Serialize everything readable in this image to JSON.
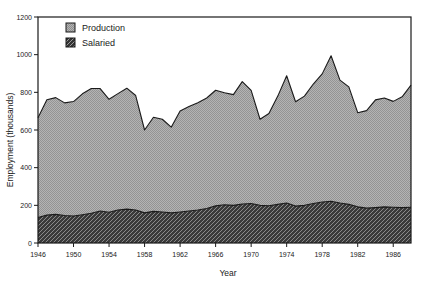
{
  "chart_data": {
    "type": "area",
    "stacked": true,
    "title": "",
    "xlabel": "Year",
    "ylabel": "Employment (thousands)",
    "xlim": [
      1946,
      1988
    ],
    "ylim": [
      0,
      1200
    ],
    "yticks": [
      0,
      200,
      400,
      600,
      800,
      1000,
      1200
    ],
    "xticks": [
      1946,
      1950,
      1954,
      1958,
      1962,
      1966,
      1970,
      1974,
      1978,
      1982,
      1986
    ],
    "grid": false,
    "legend_position": "top-left",
    "x": [
      1946,
      1947,
      1948,
      1949,
      1950,
      1951,
      1952,
      1953,
      1954,
      1955,
      1956,
      1957,
      1958,
      1959,
      1960,
      1961,
      1962,
      1963,
      1964,
      1965,
      1966,
      1967,
      1968,
      1969,
      1970,
      1971,
      1972,
      1973,
      1974,
      1975,
      1976,
      1977,
      1978,
      1979,
      1980,
      1981,
      1982,
      1983,
      1984,
      1985,
      1986,
      1987,
      1988
    ],
    "series": [
      {
        "name": "Salaried",
        "fill_color": "#3b3b3b",
        "pattern": "diagonal-hatch",
        "values": [
          135,
          148,
          152,
          146,
          143,
          150,
          158,
          170,
          163,
          175,
          180,
          175,
          160,
          168,
          165,
          160,
          165,
          170,
          175,
          183,
          197,
          203,
          200,
          207,
          210,
          200,
          198,
          205,
          212,
          196,
          200,
          210,
          218,
          222,
          212,
          205,
          192,
          185,
          188,
          192,
          190,
          188,
          190
        ]
      },
      {
        "name": "Production",
        "fill_color": "#a8a8a8",
        "pattern": "stipple",
        "values": [
          530,
          613,
          620,
          598,
          608,
          642,
          662,
          650,
          600,
          618,
          642,
          608,
          440,
          500,
          492,
          455,
          536,
          555,
          570,
          587,
          614,
          595,
          588,
          650,
          600,
          457,
          490,
          575,
          676,
          554,
          580,
          634,
          680,
          772,
          653,
          624,
          500,
          518,
          572,
          578,
          562,
          588,
          648
        ]
      }
    ],
    "totals": [
      665,
      761,
      772,
      744,
      751,
      792,
      820,
      820,
      763,
      793,
      822,
      783,
      600,
      668,
      657,
      615,
      701,
      725,
      745,
      770,
      811,
      798,
      788,
      857,
      810,
      657,
      688,
      780,
      888,
      750,
      780,
      844,
      898,
      994,
      865,
      829,
      692,
      703,
      760,
      770,
      752,
      776,
      838
    ],
    "series_order_bottom_to_top": [
      "Salaried",
      "Production"
    ]
  },
  "legend": {
    "items": [
      {
        "label": "Production",
        "swatch": "production-swatch"
      },
      {
        "label": "Salaried",
        "swatch": "salaried-swatch"
      }
    ]
  },
  "axes": {
    "y_title": "Employment (thousands)",
    "x_title": "Year",
    "y_tick_labels": [
      "0",
      "200",
      "400",
      "600",
      "800",
      "1000",
      "1200"
    ],
    "x_tick_labels": [
      "1946",
      "1950",
      "1954",
      "1958",
      "1962",
      "1966",
      "1970",
      "1974",
      "1978",
      "1982",
      "1986"
    ]
  },
  "colors": {
    "production": "#a8a8a8",
    "salaried": "#3b3b3b",
    "outline": "#1a1a1a",
    "background": "#ffffff"
  }
}
